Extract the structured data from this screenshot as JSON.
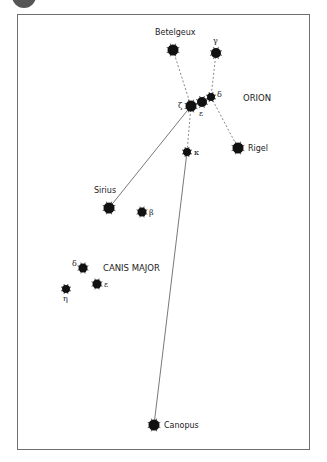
{
  "colors": {
    "star": "#111111",
    "line": "#555555",
    "frame": "#6f6f6f",
    "text": "#222222"
  },
  "constellations": [
    {
      "name": "ORION",
      "x": 243,
      "y": 101
    },
    {
      "name": "CANIS MAJOR",
      "x": 103,
      "y": 271
    }
  ],
  "stars": [
    {
      "id": "betelgeux",
      "label": "Betelgeux",
      "greek": false,
      "x": 173,
      "y": 50,
      "r": 5.5,
      "lx": 155,
      "ly": 35
    },
    {
      "id": "gamma-ori",
      "label": "γ",
      "greek": true,
      "x": 216,
      "y": 53,
      "r": 5,
      "lx": 213,
      "ly": 43
    },
    {
      "id": "delta-ori",
      "label": "δ",
      "greek": true,
      "x": 211,
      "y": 97,
      "r": 4,
      "lx": 217,
      "ly": 97
    },
    {
      "id": "epsilon-ori",
      "label": "ε",
      "greek": true,
      "x": 202,
      "y": 102,
      "r": 5,
      "lx": 199,
      "ly": 116
    },
    {
      "id": "zeta-ori",
      "label": "ζ",
      "greek": true,
      "x": 191,
      "y": 106,
      "r": 5.5,
      "lx": 178,
      "ly": 108
    },
    {
      "id": "rigel",
      "label": "Rigel",
      "greek": false,
      "x": 238,
      "y": 148,
      "r": 5.5,
      "lx": 248,
      "ly": 151
    },
    {
      "id": "kappa-ori",
      "label": "κ",
      "greek": true,
      "x": 187,
      "y": 152,
      "r": 4,
      "lx": 194,
      "ly": 155
    },
    {
      "id": "sirius",
      "label": "Sirius",
      "greek": false,
      "x": 109,
      "y": 208,
      "r": 5.5,
      "lx": 94,
      "ly": 193
    },
    {
      "id": "beta-cma",
      "label": "β",
      "greek": true,
      "x": 142,
      "y": 212,
      "r": 4.5,
      "lx": 149,
      "ly": 215
    },
    {
      "id": "delta-cma",
      "label": "δ",
      "greek": true,
      "x": 83,
      "y": 268,
      "r": 4.5,
      "lx": 72,
      "ly": 266
    },
    {
      "id": "epsilon-cma",
      "label": "ε",
      "greek": true,
      "x": 97,
      "y": 284,
      "r": 4.5,
      "lx": 104,
      "ly": 287
    },
    {
      "id": "eta-cma",
      "label": "η",
      "greek": true,
      "x": 66,
      "y": 289,
      "r": 4,
      "lx": 63,
      "ly": 301
    },
    {
      "id": "canopus",
      "label": "Canopus",
      "greek": false,
      "x": 154,
      "y": 425,
      "r": 5.5,
      "lx": 164,
      "ly": 428
    }
  ],
  "lines": [
    {
      "from": "betelgeux",
      "to": "zeta-ori",
      "style": "dashed"
    },
    {
      "from": "gamma-ori",
      "to": "delta-ori",
      "style": "dashed"
    },
    {
      "from": "delta-ori",
      "to": "rigel",
      "style": "dashed"
    },
    {
      "from": "zeta-ori",
      "to": "kappa-ori",
      "style": "dashed"
    },
    {
      "from": "zeta-ori",
      "to": "sirius",
      "style": "solid"
    },
    {
      "from": "kappa-ori",
      "to": "canopus",
      "style": "solid"
    }
  ]
}
